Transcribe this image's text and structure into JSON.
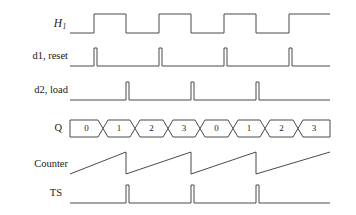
{
  "figure": {
    "kind": "digital-timing-diagram",
    "width": 356,
    "height": 215,
    "background_color": "#ffffff",
    "line_color": "#4a4a4a",
    "text_color": "#1a1a1a"
  },
  "labels": {
    "h1": "H",
    "h1_subscript": "1",
    "d1_reset": "d1, reset",
    "d2_load": "d2, load",
    "q": "Q",
    "counter": "Counter",
    "ts": "TS"
  },
  "chart_data": {
    "type": "timing",
    "title": "",
    "xlabel": "",
    "ylabel": "",
    "x_start": 70,
    "x_end": 330,
    "clock_period": 65,
    "clock_half_period": 32.5,
    "rows": [
      {
        "name": "H1",
        "label": "H1",
        "style": "clock",
        "baseline_y": 33,
        "high_y": 14,
        "rising_edges": [
          94,
          159,
          224,
          289
        ],
        "falling_edges": [
          126,
          191,
          256
        ],
        "initial_level": "low"
      },
      {
        "name": "d1_reset",
        "label": "d1, reset",
        "style": "pulse",
        "baseline_y": 66,
        "high_y": 48,
        "pulse_width": 3,
        "pulses": [
          94,
          159,
          224,
          289
        ]
      },
      {
        "name": "d2_load",
        "label": "d2, load",
        "style": "pulse",
        "baseline_y": 100,
        "high_y": 82,
        "pulse_width": 3,
        "pulses": [
          126,
          191,
          256
        ]
      },
      {
        "name": "Q",
        "label": "Q",
        "style": "bus",
        "top_y": 120,
        "bottom_y": 137,
        "transition_width": 5,
        "segment_boundaries": [
          70,
          103,
          135,
          168,
          200,
          233,
          265,
          298,
          330
        ],
        "values": [
          "0",
          "1",
          "2",
          "3",
          "0",
          "1",
          "2",
          "3"
        ]
      },
      {
        "name": "Counter",
        "label": "Counter",
        "style": "sawtooth",
        "low_y": 174,
        "high_y": 152,
        "reset_points": [
          126,
          191,
          256
        ],
        "ramp_start_x": 70,
        "ramp_end_x": 330
      },
      {
        "name": "TS",
        "label": "TS",
        "style": "pulse",
        "baseline_y": 203,
        "high_y": 185,
        "pulse_width": 3,
        "pulses": [
          126,
          191,
          256
        ]
      }
    ]
  }
}
